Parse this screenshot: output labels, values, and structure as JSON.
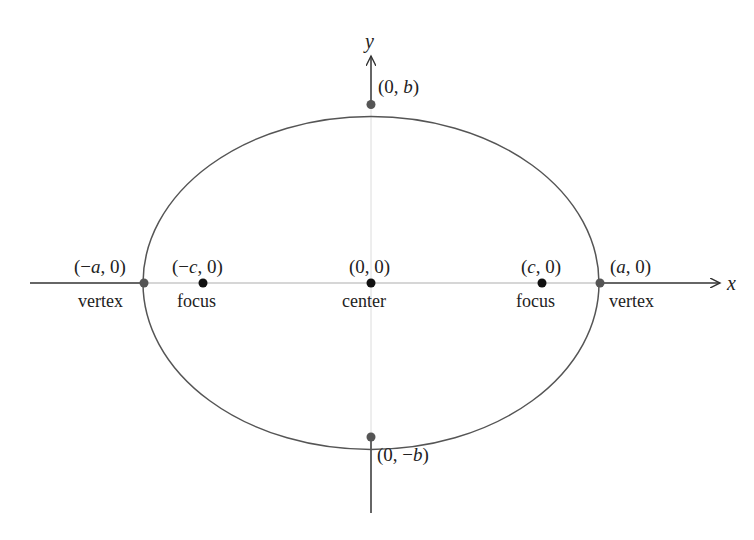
{
  "diagram": {
    "type": "ellipse-anatomy",
    "colors": {
      "background": "#ffffff",
      "ellipse_stroke": "#555555",
      "axis_stroke": "#333333",
      "axis_faint": "#c8c8c8",
      "vertex_dot": "#555555",
      "focus_dot": "#111111"
    },
    "axes": {
      "x_label": "x",
      "y_label": "y"
    },
    "points": [
      {
        "id": "top-covertex",
        "coords": "(0, b)",
        "pre": "(0, ",
        "var": "b",
        "post": ")"
      },
      {
        "id": "bottom-covertex",
        "coords": "(0, −b)",
        "pre": "(0, −",
        "var": "b",
        "post": ")"
      },
      {
        "id": "left-vertex",
        "coords": "(−a, 0)",
        "pre": "(−",
        "var": "a",
        "post": ", 0)",
        "role": "vertex"
      },
      {
        "id": "left-focus",
        "coords": "(−c, 0)",
        "pre": "(−",
        "var": "c",
        "post": ", 0)",
        "role": "focus"
      },
      {
        "id": "center",
        "coords": "(0, 0)",
        "pre": "(0, 0)",
        "var": "",
        "post": "",
        "role": "center"
      },
      {
        "id": "right-focus",
        "coords": "(c, 0)",
        "pre": "(",
        "var": "c",
        "post": ", 0)",
        "role": "focus"
      },
      {
        "id": "right-vertex",
        "coords": "(a, 0)",
        "pre": "(",
        "var": "a",
        "post": ", 0)",
        "role": "vertex"
      }
    ],
    "labels": {
      "vertex": "vertex",
      "focus": "focus",
      "center": "center"
    }
  }
}
